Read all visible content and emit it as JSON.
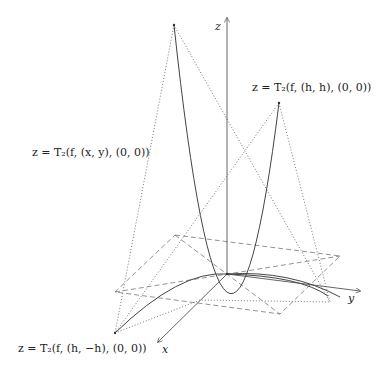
{
  "labels": {
    "z_axis": "z",
    "y_axis": "y",
    "x_axis": "x",
    "surface_xy": "z = T₂(f, (x, y), (0, 0))",
    "curve_hh": "z = T₂(f, (h, h), (0, 0))",
    "curve_h_minus_h": "z = T₂(f, (h, −h), (0, 0))"
  },
  "colors": {
    "line": "#555555",
    "text": "#222222"
  }
}
